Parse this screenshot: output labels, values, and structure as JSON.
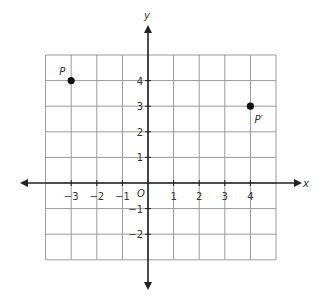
{
  "chart_data": {
    "type": "scatter",
    "title": "",
    "xlabel": "x",
    "ylabel": "y",
    "origin_label": "O",
    "xlim": [
      -4,
      5
    ],
    "ylim": [
      -3,
      5
    ],
    "grid": true,
    "x_ticks": [
      -3,
      -2,
      -1,
      1,
      2,
      3,
      4
    ],
    "x_tick_labels": [
      "−3",
      "−2",
      "−1",
      "1",
      "2",
      "3",
      "4"
    ],
    "y_ticks": [
      4,
      3,
      2,
      1,
      -1,
      -2
    ],
    "y_tick_labels": [
      "4",
      "3",
      "2",
      "1",
      "−1",
      "−2"
    ],
    "points": [
      {
        "label": "P",
        "x": -3,
        "y": 4
      },
      {
        "label": "P′",
        "x": 4,
        "y": 3
      }
    ]
  }
}
